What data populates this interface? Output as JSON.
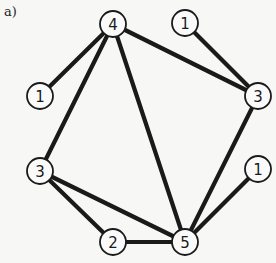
{
  "figure_label": "a)",
  "graph": {
    "nodes": [
      {
        "id": "n4_top",
        "label": "4"
      },
      {
        "id": "n1_topright",
        "label": "1"
      },
      {
        "id": "n1_left",
        "label": "1"
      },
      {
        "id": "n3_right",
        "label": "3"
      },
      {
        "id": "n3_left",
        "label": "3"
      },
      {
        "id": "n1_right",
        "label": "1"
      },
      {
        "id": "n2_bottom",
        "label": "2"
      },
      {
        "id": "n5_bottom",
        "label": "5"
      }
    ],
    "edges": [
      [
        "n4_top",
        "n1_left"
      ],
      [
        "n4_top",
        "n3_right"
      ],
      [
        "n4_top",
        "n3_left"
      ],
      [
        "n4_top",
        "n5_bottom"
      ],
      [
        "n1_topright",
        "n3_right"
      ],
      [
        "n3_right",
        "n5_bottom"
      ],
      [
        "n3_left",
        "n2_bottom"
      ],
      [
        "n3_left",
        "n5_bottom"
      ],
      [
        "n2_bottom",
        "n5_bottom"
      ],
      [
        "n1_right",
        "n5_bottom"
      ]
    ]
  }
}
